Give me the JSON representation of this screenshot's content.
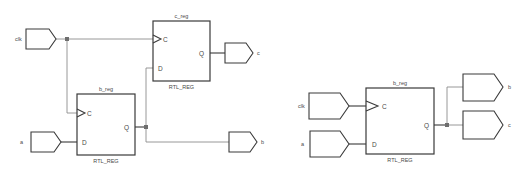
{
  "colors": {
    "outline": "#3a3a3a",
    "wire": "#8c8c8c",
    "junction": "#6e6e6e",
    "text": "#4a4a4a",
    "background": "#ffffff"
  },
  "left_schematic": {
    "inputs": [
      {
        "name": "clk"
      },
      {
        "name": "a"
      }
    ],
    "outputs": [
      {
        "name": "c"
      },
      {
        "name": "b"
      }
    ],
    "cells": [
      {
        "instance": "c_reg",
        "type": "RTL_REG",
        "pins": {
          "clock": "C",
          "data": "D",
          "out": "Q"
        }
      },
      {
        "instance": "b_reg",
        "type": "RTL_REG",
        "pins": {
          "clock": "C",
          "data": "D",
          "out": "Q"
        }
      }
    ]
  },
  "right_schematic": {
    "inputs": [
      {
        "name": "clk"
      },
      {
        "name": "a"
      }
    ],
    "outputs": [
      {
        "name": "b"
      },
      {
        "name": "c"
      }
    ],
    "cells": [
      {
        "instance": "b_reg",
        "type": "RTL_REG",
        "pins": {
          "clock": "C",
          "data": "D",
          "out": "Q"
        }
      }
    ]
  }
}
